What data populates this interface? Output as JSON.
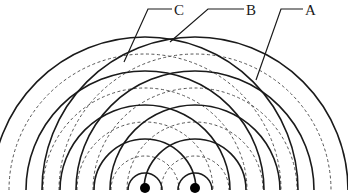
{
  "diagram": {
    "colors": {
      "crest": "#1a1a1a",
      "trough": "#555555",
      "source": "#000000",
      "leader": "#1a1a1a",
      "background": "#ffffff"
    },
    "sources": [
      {
        "id": "S1",
        "x": 145,
        "y": 188,
        "radius": 5
      },
      {
        "id": "S2",
        "x": 195,
        "y": 188,
        "radius": 5
      }
    ],
    "crest_radii": [
      17,
      51,
      85,
      119,
      153
    ],
    "trough_radii": [
      34,
      68,
      102,
      136
    ],
    "labels": [
      {
        "text": "C",
        "text_x": 174,
        "text_y": 15,
        "line": [
          [
            172,
            9
          ],
          [
            148,
            9
          ],
          [
            124,
            62
          ]
        ]
      },
      {
        "text": "B",
        "text_x": 246,
        "text_y": 15,
        "line": [
          [
            244,
            9
          ],
          [
            208,
            9
          ],
          [
            170,
            42
          ]
        ]
      },
      {
        "text": "A",
        "text_x": 305,
        "text_y": 15,
        "line": [
          [
            303,
            9
          ],
          [
            281,
            9
          ],
          [
            256,
            80
          ]
        ]
      }
    ]
  }
}
